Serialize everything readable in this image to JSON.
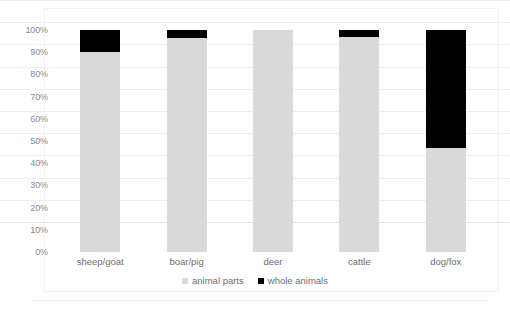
{
  "chart_data": {
    "type": "bar",
    "title": "",
    "subtitle": "",
    "xlabel": "",
    "ylabel": "",
    "stacked": true,
    "normalized_percent": true,
    "grid": true,
    "legend_position": "bottom-center",
    "ylim": [
      0,
      100
    ],
    "ytick_labels": [
      "100%",
      "90%",
      "80%",
      "70%",
      "60%",
      "50%",
      "40%",
      "30%",
      "20%",
      "10%",
      "0%"
    ],
    "ytick_values": [
      100,
      90,
      80,
      70,
      60,
      50,
      40,
      30,
      20,
      10,
      0
    ],
    "categories": [
      "sheep/goat",
      "boar/pig",
      "deer",
      "cattle",
      "dog/fox"
    ],
    "series": [
      {
        "name": "animal parts",
        "color": "#d9d9d9",
        "values": [
          90,
          96.5,
          100,
          97,
          47
        ]
      },
      {
        "name": "whole animals",
        "color": "#000000",
        "values": [
          10,
          3.5,
          0,
          3,
          53
        ]
      }
    ]
  },
  "legend": {
    "items": [
      {
        "label": "animal parts",
        "swatch": "gray-square-icon"
      },
      {
        "label": "whole animals",
        "swatch": "black-square-icon"
      }
    ]
  }
}
